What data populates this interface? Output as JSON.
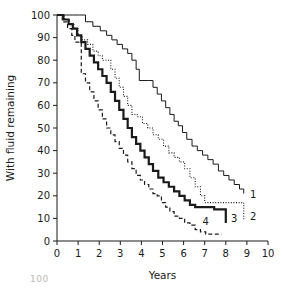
{
  "figure": {
    "artifact_text": "100"
  },
  "chart_data": {
    "type": "line",
    "subtype": "kaplan-meier-step",
    "title": "",
    "xlabel": "Years",
    "ylabel": "With fluid remaining",
    "xlim": [
      0,
      10
    ],
    "ylim": [
      0,
      100
    ],
    "xticks": [
      0,
      1,
      2,
      3,
      4,
      5,
      6,
      7,
      8,
      9,
      10
    ],
    "yticks": [
      0,
      10,
      20,
      30,
      40,
      50,
      60,
      70,
      80,
      90,
      100
    ],
    "grid": false,
    "legend": "inline-end-labels",
    "colors": {
      "ink": "#1a1a1a",
      "background": "#ffffff"
    },
    "series": [
      {
        "name": "1",
        "label": "1",
        "style": "solid-thin",
        "stroke_width": 1,
        "dash": "none",
        "label_x": 9.05,
        "label_y": 21,
        "x": [
          0,
          0.45,
          0.75,
          1.05,
          1.35,
          1.7,
          2.05,
          2.35,
          2.6,
          2.85,
          3.1,
          3.35,
          3.55,
          3.75,
          3.9,
          4.35,
          4.55,
          4.75,
          4.95,
          5.15,
          5.35,
          5.55,
          5.75,
          5.95,
          6.15,
          6.4,
          6.65,
          6.9,
          7.15,
          7.4,
          7.65,
          7.9,
          8.15,
          8.4,
          8.65,
          8.85
        ],
        "y": [
          100,
          100,
          100,
          100,
          97,
          95,
          93,
          91,
          89,
          87,
          85,
          83,
          80,
          76,
          71,
          71,
          68,
          65,
          62,
          59,
          56,
          53,
          51,
          48,
          45,
          42,
          40,
          38,
          36,
          34,
          31,
          29,
          27,
          25,
          23,
          21
        ]
      },
      {
        "name": "2",
        "label": "2",
        "style": "dotted",
        "stroke_width": 1.1,
        "dash": "1,1.6",
        "label_x": 9.05,
        "label_y": 11,
        "x": [
          0,
          0.35,
          0.6,
          0.8,
          1.0,
          1.2,
          1.45,
          1.7,
          1.95,
          2.15,
          2.35,
          2.55,
          2.75,
          2.95,
          3.15,
          3.35,
          3.55,
          3.8,
          4.05,
          4.3,
          4.55,
          4.8,
          5.05,
          5.3,
          5.55,
          5.8,
          6.05,
          6.3,
          6.55,
          6.8,
          7.0,
          8.85,
          8.85
        ],
        "y": [
          100,
          98,
          96,
          94,
          91,
          89,
          87,
          84,
          82,
          80,
          80,
          76,
          72,
          68,
          64,
          60,
          56,
          55,
          52,
          50,
          47,
          45,
          42,
          39,
          37,
          35,
          32,
          28,
          24,
          20,
          17,
          17,
          9
        ]
      },
      {
        "name": "3",
        "label": "3",
        "style": "solid-thick",
        "stroke_width": 2.2,
        "dash": "none",
        "label_x": 8.15,
        "label_y": 10,
        "x": [
          0,
          0.3,
          0.55,
          0.75,
          0.95,
          1.15,
          1.35,
          1.55,
          1.75,
          1.95,
          2.15,
          2.35,
          2.55,
          2.75,
          2.95,
          3.15,
          3.35,
          3.55,
          3.75,
          3.95,
          4.15,
          4.35,
          4.55,
          4.8,
          5.05,
          5.3,
          5.55,
          5.8,
          6.05,
          6.3,
          6.55,
          7.0,
          7.45,
          7.8,
          8.0
        ],
        "y": [
          100,
          98,
          96,
          94,
          91,
          88,
          85,
          82,
          79,
          76,
          73,
          70,
          66,
          62,
          58,
          54,
          50,
          46,
          43,
          40,
          37,
          34,
          31,
          28,
          26,
          24,
          22,
          20,
          18,
          16,
          15,
          15,
          14,
          14,
          8
        ]
      },
      {
        "name": "4",
        "label": "4",
        "style": "dashed",
        "stroke_width": 1.2,
        "dash": "4,2.5",
        "label_x": 6.8,
        "label_y": 9,
        "x": [
          0,
          0.25,
          0.5,
          0.7,
          0.85,
          1.05,
          1.15,
          1.35,
          1.55,
          1.75,
          1.95,
          2.15,
          2.35,
          2.55,
          2.75,
          2.95,
          3.15,
          3.35,
          3.55,
          3.75,
          3.95,
          4.15,
          4.35,
          4.55,
          4.75,
          4.95,
          5.15,
          5.35,
          5.55,
          5.8,
          6.05,
          6.3,
          6.55,
          6.8,
          7.05,
          7.8
        ],
        "y": [
          100,
          97,
          94,
          91,
          88,
          88,
          74,
          70,
          66,
          62,
          58,
          54,
          50,
          47,
          44,
          41,
          38,
          35,
          32,
          29,
          27,
          25,
          23,
          21,
          20,
          17,
          15,
          13,
          11,
          10,
          8,
          7,
          5,
          4,
          3,
          3
        ]
      }
    ]
  }
}
